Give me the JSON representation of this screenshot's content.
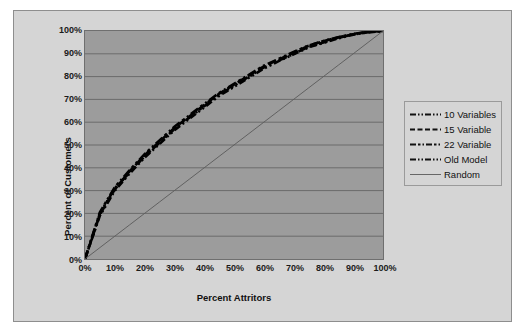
{
  "chart_data": {
    "type": "line",
    "title": "",
    "xlabel": "Percent Attritors",
    "ylabel": "Percent of Customers",
    "xlim": [
      0,
      100
    ],
    "ylim": [
      0,
      100
    ],
    "grid": "horizontal",
    "legend_position": "right",
    "x_ticks": [
      "0%",
      "10%",
      "20%",
      "30%",
      "40%",
      "50%",
      "60%",
      "70%",
      "80%",
      "90%",
      "100%"
    ],
    "y_ticks": [
      "0%",
      "10%",
      "20%",
      "30%",
      "40%",
      "50%",
      "60%",
      "70%",
      "80%",
      "90%",
      "100%"
    ],
    "x": [
      0,
      5,
      10,
      15,
      20,
      25,
      30,
      35,
      40,
      45,
      50,
      55,
      60,
      65,
      70,
      75,
      80,
      85,
      90,
      95,
      100
    ],
    "series": [
      {
        "name": "10 Variables",
        "dash": "9,3,2,3,2,3",
        "color": "#000000",
        "width": 2.6,
        "values": [
          0,
          20,
          31,
          38,
          45,
          51,
          57,
          62,
          67,
          72,
          76,
          80,
          84,
          87,
          90,
          93,
          95,
          97,
          98.5,
          99.5,
          100
        ]
      },
      {
        "name": "15 Variable",
        "dash": "8,4",
        "color": "#000000",
        "width": 2.6,
        "values": [
          0,
          19.5,
          30.5,
          38.5,
          45.5,
          51.5,
          57.5,
          62.5,
          67.5,
          72.5,
          76.5,
          80.5,
          84.5,
          87.5,
          90.5,
          93.5,
          95.5,
          97.2,
          98.6,
          99.6,
          100
        ]
      },
      {
        "name": "22 Variable",
        "dash": "9,3,3,3,2,3",
        "color": "#000000",
        "width": 2.6,
        "values": [
          0,
          20.5,
          31.5,
          39,
          46,
          52,
          58,
          63,
          68,
          72.8,
          76.8,
          80.8,
          84.8,
          87.8,
          90.8,
          93.6,
          95.6,
          97.3,
          98.7,
          99.7,
          100
        ]
      },
      {
        "name": "Old Model",
        "dash": "7,3,2,3,2,3",
        "color": "#000000",
        "width": 2.6,
        "values": [
          0,
          19,
          30,
          37.5,
          44.5,
          50.5,
          56.5,
          61.5,
          66.5,
          71.5,
          75.5,
          79.5,
          83.5,
          86.8,
          89.8,
          92.8,
          94.8,
          96.8,
          98.4,
          99.4,
          100
        ]
      },
      {
        "name": "Random",
        "dash": "none",
        "color": "#5a5a5a",
        "width": 0.9,
        "values": [
          0,
          5,
          10,
          15,
          20,
          25,
          30,
          35,
          40,
          45,
          50,
          55,
          60,
          65,
          70,
          75,
          80,
          85,
          90,
          95,
          100
        ]
      }
    ]
  },
  "legend": {
    "items": [
      {
        "label": "10 Variables",
        "swatch": "dash-dot-dot"
      },
      {
        "label": "15 Variable",
        "swatch": "dashed"
      },
      {
        "label": "22 Variable",
        "swatch": "dash-dot-dash"
      },
      {
        "label": "Old Model",
        "swatch": "dash-dot-dot"
      },
      {
        "label": "Random",
        "swatch": "solid-thin"
      }
    ]
  },
  "colors": {
    "frame_background": "#d5d5d5",
    "plot_background": "#9c9c9c",
    "gridline": "#6b6b6b",
    "series_line": "#000000",
    "random_line": "#5a5a5a",
    "text": "#111111"
  }
}
